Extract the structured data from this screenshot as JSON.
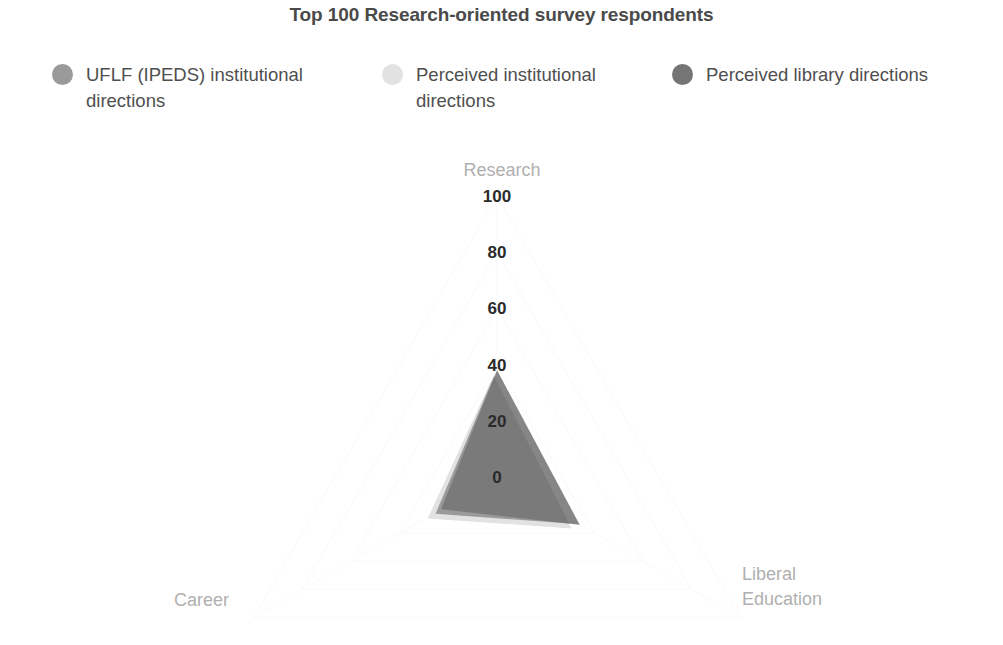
{
  "chart_data": {
    "type": "radar",
    "title": "Top 100 Research-oriented survey respondents",
    "axes": [
      "Research",
      "Career",
      "Liberal Education"
    ],
    "axis_labels": {
      "top": "Research",
      "bottom_left": "Career",
      "bottom_right": "Liberal\nEducation"
    },
    "radial_ticks": [
      100,
      80,
      60,
      40,
      20,
      0
    ],
    "radial_tick_labels": [
      "100",
      "80",
      "60",
      "40",
      "20",
      "0"
    ],
    "rlim": [
      0,
      100
    ],
    "grid": true,
    "legend_position": "top",
    "series": [
      {
        "name": "UFLF (IPEDS) institutional directions",
        "color": "#9a9a9a",
        "values": [
          37,
          24,
          31
        ]
      },
      {
        "name": "Perceived institutional directions",
        "color": "#e2e2e2",
        "values": [
          36,
          26,
          33
        ]
      },
      {
        "name": "Perceived library directions",
        "color": "#757575",
        "values": [
          38,
          23,
          34
        ]
      }
    ]
  },
  "legend": {
    "items": [
      {
        "label": "UFLF (IPEDS)\ninstitutional directions",
        "color": "#9a9a9a"
      },
      {
        "label": "Perceived institutional\ndirections",
        "color": "#e2e2e2"
      },
      {
        "label": "Perceived library\ndirections",
        "color": "#757575"
      }
    ]
  }
}
